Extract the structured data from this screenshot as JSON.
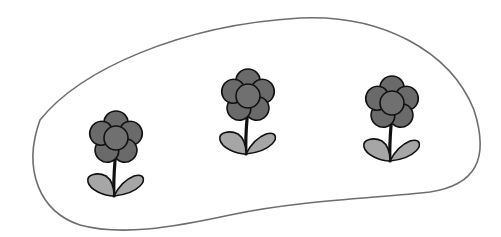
{
  "scene": {
    "description": "Three identical stylized flowers inside a closed blob-shaped outline",
    "background_color": "#ffffff",
    "outline_color": "#6e6e6e",
    "petal_fill": "#6a6a6a",
    "center_fill": "#707070",
    "leaf_fill": "#a6a6a6",
    "stroke_color": "#111111"
  },
  "region": {
    "name": "enclosing-blob"
  },
  "flowers": [
    {
      "name": "flower-left",
      "cx": 116,
      "cy": 138
    },
    {
      "name": "flower-middle",
      "cx": 248,
      "cy": 96
    },
    {
      "name": "flower-right",
      "cx": 392,
      "cy": 103
    }
  ]
}
